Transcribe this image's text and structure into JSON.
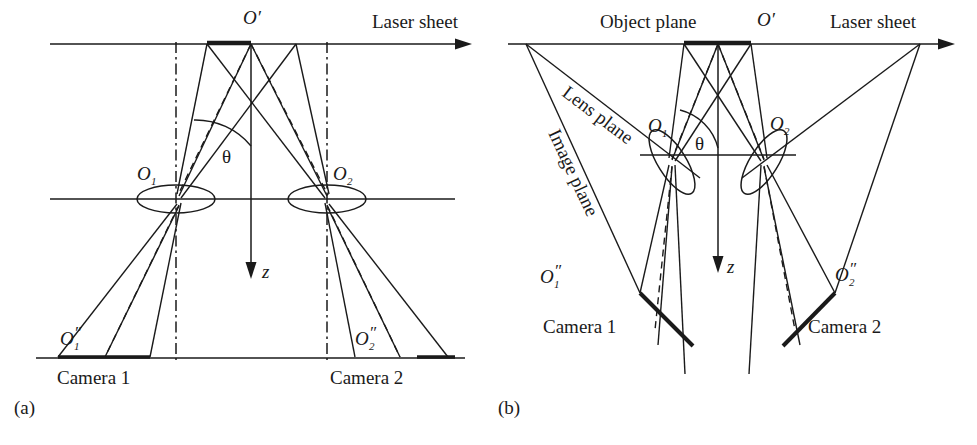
{
  "figure": {
    "type": "diagram",
    "stroke_color": "#1a1a1a",
    "background_color": "#ffffff"
  },
  "panels": [
    {
      "id": "a",
      "caption": "(a)",
      "name": "translation-configuration",
      "labels": {
        "laser_sheet": "Laser sheet",
        "object_point": "O′",
        "lens_1": "O",
        "lens_1_sub": "1",
        "lens_2": "O",
        "lens_2_sub": "2",
        "image_1": "O",
        "image_1_sub": "1",
        "image_1_prime": "″",
        "image_2": "O",
        "image_2_sub": "2",
        "image_2_prime": "″",
        "camera_1": "Camera 1",
        "camera_2": "Camera 2",
        "angle": "θ",
        "axis_z": "z"
      }
    },
    {
      "id": "b",
      "caption": "(b)",
      "name": "scheimpflug-configuration",
      "labels": {
        "object_plane": "Object plane",
        "laser_sheet": "Laser sheet",
        "object_point": "O′",
        "lens_plane": "Lens plane",
        "image_plane": "Image plane",
        "lens_1": "O",
        "lens_1_sub": "1",
        "lens_2": "O",
        "lens_2_sub": "2",
        "image_1": "O",
        "image_1_sub": "1",
        "image_1_prime": "″",
        "image_2": "O",
        "image_2_sub": "2",
        "image_2_prime": "″",
        "camera_1": "Camera 1",
        "camera_2": "Camera 2",
        "angle": "θ",
        "axis_z": "z"
      }
    }
  ]
}
